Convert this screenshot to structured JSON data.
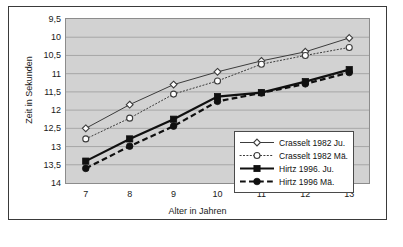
{
  "chart_data": {
    "type": "line",
    "title": "",
    "xlabel": "Alter in Jahren",
    "ylabel": "Zeit in Sekunden",
    "x": [
      7,
      8,
      9,
      10,
      11,
      12,
      13
    ],
    "xtick_labels": [
      "7",
      "8",
      "9",
      "10",
      "11",
      "12",
      "13"
    ],
    "xlim": [
      6.55,
      13.45
    ],
    "ylim": [
      9.5,
      14
    ],
    "y_inverted": true,
    "ytick_values": [
      9.5,
      10,
      10.5,
      11,
      11.5,
      12,
      12.5,
      13,
      13.5,
      14
    ],
    "ytick_labels": [
      "9,5",
      "10",
      "10,5",
      "11",
      "11,5",
      "12",
      "12,5",
      "13",
      "13,5",
      "14"
    ],
    "grid": "horizontal",
    "plot_background": "#d2d2d2",
    "legend_position": "lower right",
    "series": [
      {
        "name": "Crasselt 1982 Ju.",
        "values": [
          12.5,
          11.85,
          11.3,
          10.95,
          10.65,
          10.4,
          10.02
        ],
        "color": "#3c3c3c",
        "linestyle": "solid",
        "linewidth": 1,
        "marker": "diamond-open"
      },
      {
        "name": "Crasselt 1982 Mä.",
        "values": [
          12.79,
          12.22,
          11.56,
          11.2,
          10.74,
          10.5,
          10.28
        ],
        "color": "#3c3c3c",
        "linestyle": "dotted",
        "linewidth": 1,
        "marker": "circle-open"
      },
      {
        "name": "Hirtz 1996. Ju.",
        "values": [
          13.4,
          12.79,
          12.25,
          11.63,
          11.52,
          11.22,
          10.89
        ],
        "color": "#101010",
        "linestyle": "solid",
        "linewidth": 2.2,
        "marker": "square-filled"
      },
      {
        "name": "Hirtz 1996 Mä.",
        "values": [
          13.6,
          12.99,
          12.44,
          11.76,
          11.53,
          11.28,
          10.97
        ],
        "color": "#101010",
        "linestyle": "dashed",
        "linewidth": 2.2,
        "marker": "circle-filled"
      }
    ]
  },
  "legend": {
    "entries": [
      "Crasselt 1982 Ju.",
      "Crasselt 1982 Mä.",
      "Hirtz 1996. Ju.",
      "Hirtz 1996 Mä."
    ]
  }
}
